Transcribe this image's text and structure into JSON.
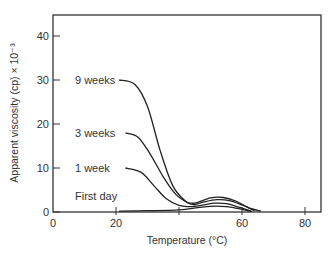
{
  "chart_data": {
    "type": "line",
    "title": "",
    "xlabel": "Temperature (°C)",
    "ylabel": "Apparent viscosity (cp) × 10⁻³",
    "xlim": [
      0,
      85
    ],
    "ylim": [
      0,
      45
    ],
    "xticks": [
      0,
      20,
      40,
      60,
      80
    ],
    "xtick_labels": [
      "0",
      "20",
      "",
      "60",
      "80"
    ],
    "yticks": [
      0,
      10,
      20,
      30,
      40
    ],
    "ytick_labels": [
      "0",
      "10",
      "20",
      "30",
      "40"
    ],
    "grid": false,
    "legend": "inline labels left of curves",
    "series": [
      {
        "name": "9 weeks",
        "x": [
          21,
          26,
          30,
          34,
          38,
          42,
          44,
          46,
          50,
          54,
          58,
          62,
          66
        ],
        "y": [
          30,
          29,
          24,
          14,
          6,
          2.5,
          2,
          2.2,
          3.2,
          3.3,
          2.5,
          1,
          0.2
        ]
      },
      {
        "name": "3 weeks",
        "x": [
          23,
          27,
          31,
          35,
          39,
          43,
          45,
          48,
          52,
          56,
          60,
          64
        ],
        "y": [
          18,
          17,
          13,
          8,
          4,
          2,
          1.7,
          2.3,
          2.8,
          2.6,
          1.6,
          0.3
        ]
      },
      {
        "name": "1 week",
        "x": [
          23,
          28,
          32,
          36,
          40,
          44,
          47,
          51,
          55,
          59,
          63
        ],
        "y": [
          10,
          9,
          6,
          3,
          1.5,
          1.2,
          1.5,
          2.0,
          1.9,
          1.1,
          0.2
        ]
      },
      {
        "name": "First day",
        "x": [
          21,
          30,
          40,
          46,
          50,
          55,
          60,
          63
        ],
        "y": [
          0.2,
          0.3,
          0.5,
          1.0,
          1.3,
          1.2,
          0.6,
          0.1
        ]
      }
    ]
  },
  "labels": {
    "series": [
      "9 weeks",
      "3 weeks",
      "1 week",
      "First day"
    ]
  }
}
